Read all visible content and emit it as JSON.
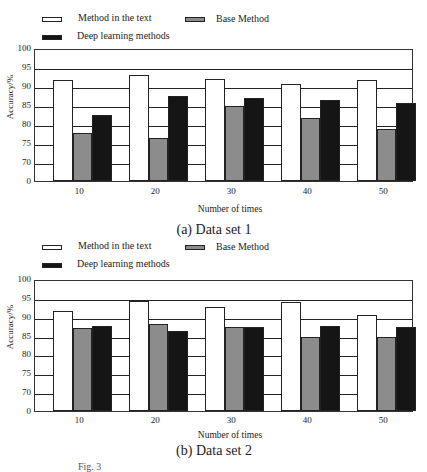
{
  "chart_data": [
    {
      "type": "bar",
      "title": "(a) Data set 1",
      "xlabel": "Number of times",
      "ylabel": "Accuracy/%",
      "categories": [
        "10",
        "20",
        "30",
        "40",
        "50"
      ],
      "yticks": [
        "0",
        "70",
        "75",
        "80",
        "85",
        "90",
        "95",
        "100"
      ],
      "ylim": [
        70,
        100
      ],
      "axis_break": "y-axis jumps from 0 to 70",
      "grid": true,
      "legend_position": "top",
      "series": [
        {
          "name": "Method in the text",
          "color": "#ffffff",
          "values": [
            91.6,
            92.9,
            91.8,
            90.5,
            91.5
          ]
        },
        {
          "name": "Base Method",
          "color": "#8c8c8c",
          "values": [
            77.6,
            76.3,
            84.7,
            81.7,
            78.7
          ]
        },
        {
          "name": "Deep learning methods",
          "color": "#151515",
          "values": [
            82.4,
            87.4,
            86.8,
            86.3,
            85.6
          ]
        }
      ]
    },
    {
      "type": "bar",
      "title": "(b) Data set 2",
      "xlabel": "Number of times",
      "ylabel": "Accuracy/%",
      "categories": [
        "10",
        "20",
        "30",
        "40",
        "50"
      ],
      "yticks": [
        "0",
        "70",
        "75",
        "80",
        "85",
        "90",
        "95",
        "100"
      ],
      "ylim": [
        70,
        100
      ],
      "axis_break": "y-axis jumps from 0 to 70",
      "grid": true,
      "legend_position": "top",
      "series": [
        {
          "name": "Method in the text",
          "color": "#ffffff",
          "values": [
            91.5,
            94.2,
            92.5,
            93.9,
            90.5
          ]
        },
        {
          "name": "Base Method",
          "color": "#8c8c8c",
          "values": [
            87.0,
            88.0,
            87.4,
            84.7,
            84.6
          ]
        },
        {
          "name": "Deep learning methods",
          "color": "#151515",
          "values": [
            87.6,
            86.2,
            87.4,
            87.6,
            87.2
          ]
        }
      ]
    }
  ],
  "figure_caption": "Fig. 3"
}
